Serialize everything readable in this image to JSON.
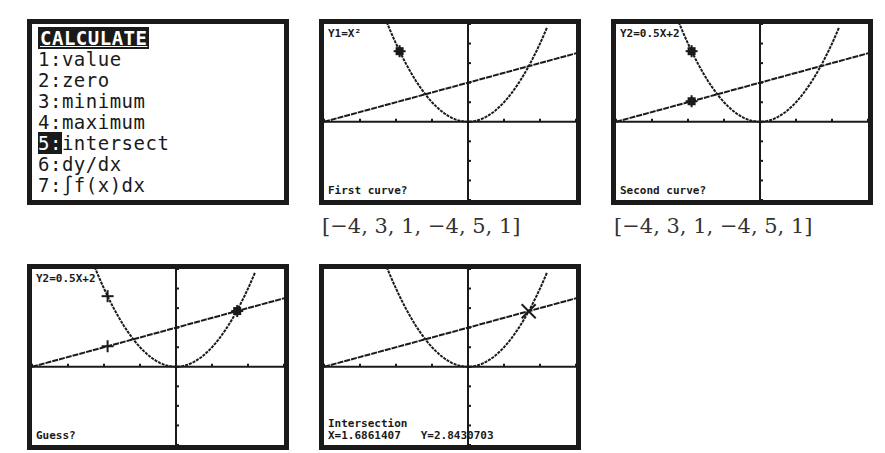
{
  "menu": {
    "title": "CALCULATE",
    "items": [
      {
        "num": "1",
        "label": "value"
      },
      {
        "num": "2",
        "label": "zero"
      },
      {
        "num": "3",
        "label": "minimum"
      },
      {
        "num": "4",
        "label": "maximum"
      },
      {
        "num": "5",
        "label": "intersect",
        "selected": true
      },
      {
        "num": "6",
        "label": "dy/dx"
      },
      {
        "num": "7",
        "label": "∫f(x)dx"
      }
    ]
  },
  "screens": [
    {
      "top_label": "Y1=X²",
      "bottom_label": "First curve?",
      "window": "[−4, 3, 1, −4, 5, 1]"
    },
    {
      "top_label": "Y2=0.5X+2",
      "bottom_label": "Second curve?",
      "window": "[−4, 3, 1, −4, 5, 1]"
    },
    {
      "top_label": "Y2=0.5X+2",
      "bottom_label": "Guess?"
    },
    {
      "top_label": "",
      "bottom_label": "Intersection",
      "result_x": "X=1.6861407",
      "result_y": "Y=2.8430703"
    }
  ],
  "functions": {
    "y1": "X^2",
    "y2": "0.5X+2"
  },
  "viewing_window": {
    "xmin": -4,
    "xmax": 3,
    "xscl": 1,
    "ymin": -4,
    "ymax": 5,
    "yscl": 1
  },
  "intersection": {
    "x": 1.6861407,
    "y": 2.8430703
  }
}
